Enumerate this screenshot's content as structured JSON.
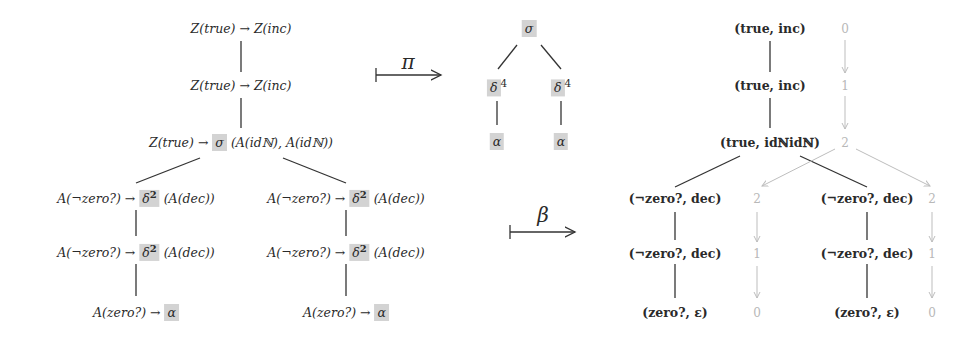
{
  "left_tree": {
    "nodes": [
      {
        "id": "l0",
        "lhs": "Z(true)",
        "rhs": "Z(inc)"
      },
      {
        "id": "l1",
        "lhs": "Z(true)",
        "rhs": "Z(inc)"
      },
      {
        "id": "l2",
        "lhs": "Z(true)",
        "head": "σ",
        "args": "(A(idℕ), A(idℕ))"
      },
      {
        "id": "l3a",
        "lhs": "A(¬zero?)",
        "head": "δ",
        "exp": "2",
        "args": "(A(dec))"
      },
      {
        "id": "l3b",
        "lhs": "A(¬zero?)",
        "head": "δ",
        "exp": "2",
        "args": "(A(dec))"
      },
      {
        "id": "l4a",
        "lhs": "A(¬zero?)",
        "head": "δ",
        "exp": "2",
        "args": "(A(dec))"
      },
      {
        "id": "l4b",
        "lhs": "A(¬zero?)",
        "head": "δ",
        "exp": "2",
        "args": "(A(dec))"
      },
      {
        "id": "l5a",
        "lhs": "A(zero?)",
        "head": "α"
      },
      {
        "id": "l5b",
        "lhs": "A(zero?)",
        "head": "α"
      }
    ],
    "arrow": "→"
  },
  "pi_map": {
    "label": "π"
  },
  "beta_map": {
    "label": "β"
  },
  "mid_tree": {
    "root": "σ",
    "children": [
      {
        "head": "δ",
        "exp": "4",
        "leaf": "α"
      },
      {
        "head": "δ",
        "exp": "4",
        "leaf": "α"
      }
    ]
  },
  "right_tree": {
    "nodes": [
      {
        "label": "(true, inc)",
        "count": "0"
      },
      {
        "label": "(true, inc)",
        "count": "1"
      },
      {
        "label": "(true, idℕidℕ)",
        "count": "2"
      },
      {
        "label": "(¬zero?, dec)",
        "count": "2"
      },
      {
        "label": "(¬zero?, dec)",
        "count": "2"
      },
      {
        "label": "(¬zero?, dec)",
        "count": "1"
      },
      {
        "label": "(¬zero?, dec)",
        "count": "1"
      },
      {
        "label": "(zero?, ε)",
        "count": "0"
      },
      {
        "label": "(zero?, ε)",
        "count": "0"
      }
    ]
  },
  "colors": {
    "highlight": "#d3d3d3",
    "counter": "#b8b8b8",
    "edge": "#333333"
  }
}
